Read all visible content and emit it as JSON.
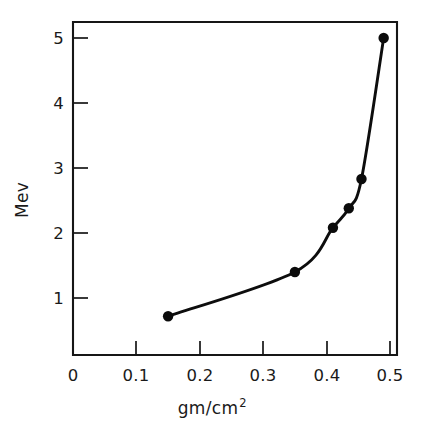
{
  "figure": {
    "background_color": "#ffffff",
    "ink_color": "#111111"
  },
  "chart_data": {
    "type": "line",
    "title": "",
    "subtitle": "",
    "xlabel": "gm/cm2",
    "xlabel_base": "gm/cm",
    "xlabel_exponent": "2",
    "ylabel": "Mev",
    "xlim": [
      0,
      0.52
    ],
    "ylim": [
      0,
      5.4
    ],
    "grid": false,
    "legend": "none",
    "marker": "filled-circle",
    "line_color": "#0d0d0d",
    "marker_color": "#0b0b0b",
    "x_tick_labels": [
      "0",
      "0.1",
      "0.2",
      "0.3",
      "0.4",
      "0.5"
    ],
    "x_tick_values": [
      0,
      0.1,
      0.2,
      0.3,
      0.4,
      0.5
    ],
    "y_tick_labels": [
      "1",
      "2",
      "3",
      "4",
      "5"
    ],
    "y_tick_values": [
      1,
      2,
      3,
      4,
      5
    ],
    "x": [
      0.15,
      0.35,
      0.41,
      0.435,
      0.455,
      0.49
    ],
    "y": [
      0.72,
      1.4,
      2.08,
      2.38,
      2.83,
      5.0
    ],
    "points": [
      {
        "x": 0.15,
        "y": 0.72
      },
      {
        "x": 0.35,
        "y": 1.4
      },
      {
        "x": 0.41,
        "y": 2.08
      },
      {
        "x": 0.435,
        "y": 2.38
      },
      {
        "x": 0.455,
        "y": 2.83
      },
      {
        "x": 0.49,
        "y": 5.0
      }
    ],
    "annotations": []
  }
}
